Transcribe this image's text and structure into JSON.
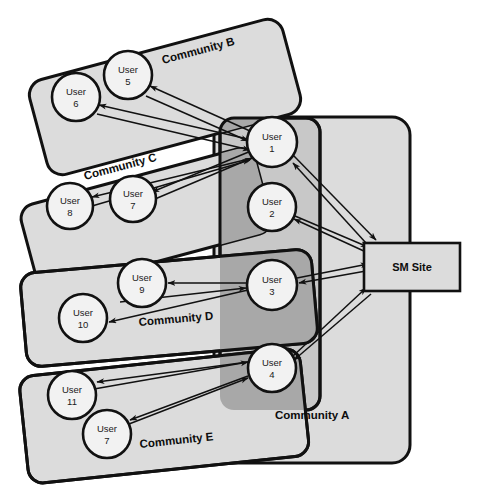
{
  "diagram": {
    "type": "node-link-diagram",
    "colors": {
      "community_fill_light": "#dcdcdc",
      "community_fill_mid": "#c8c8c8",
      "community_overlap_dark": "#a8a8a8",
      "node_fill": "#f2f2f2",
      "stroke": "#111111",
      "background": "#ffffff"
    },
    "site": {
      "label": "SM Site",
      "x": 364,
      "y": 243,
      "width": 96,
      "height": 48
    },
    "communities": [
      {
        "id": "A",
        "label": "Community A",
        "rotation": 0,
        "label_x": 275,
        "label_y": 419,
        "members": [
          "User 1",
          "User 2",
          "User 3",
          "User 4"
        ]
      },
      {
        "id": "B",
        "label": "Community B",
        "rotation": -15,
        "label_x": 163,
        "label_y": 64,
        "members": [
          "User 5",
          "User 6",
          "User 1"
        ]
      },
      {
        "id": "C",
        "label": "Community C",
        "rotation": -15,
        "label_x": 85,
        "label_y": 180,
        "members": [
          "User 7",
          "User 8",
          "User 1"
        ]
      },
      {
        "id": "D",
        "label": "Community D",
        "rotation": -5,
        "label_x": 139,
        "label_y": 326,
        "members": [
          "User 9",
          "User 10",
          "User 3"
        ]
      },
      {
        "id": "E",
        "label": "Community E",
        "rotation": -6,
        "label_x": 140,
        "label_y": 448,
        "members": [
          "User 11",
          "User 7",
          "User 4"
        ]
      }
    ],
    "nodes": [
      {
        "id": "u1",
        "line1": "User",
        "line2": "1",
        "cx": 272,
        "cy": 142,
        "r": 25
      },
      {
        "id": "u2",
        "line1": "User",
        "line2": "2",
        "cx": 272,
        "cy": 207,
        "r": 24
      },
      {
        "id": "u3",
        "line1": "User",
        "line2": "3",
        "cx": 272,
        "cy": 285,
        "r": 25
      },
      {
        "id": "u4",
        "line1": "User",
        "line2": "4",
        "cx": 272,
        "cy": 368,
        "r": 24
      },
      {
        "id": "u5",
        "line1": "User",
        "line2": "5",
        "cx": 128,
        "cy": 75,
        "r": 24
      },
      {
        "id": "u6",
        "line1": "User",
        "line2": "6",
        "cx": 76,
        "cy": 97,
        "r": 24
      },
      {
        "id": "u7c",
        "line1": "User",
        "line2": "7",
        "cx": 133,
        "cy": 199,
        "r": 23
      },
      {
        "id": "u8",
        "line1": "User",
        "line2": "8",
        "cx": 70,
        "cy": 206,
        "r": 23
      },
      {
        "id": "u9",
        "line1": "User",
        "line2": "9",
        "cx": 142,
        "cy": 283,
        "r": 24
      },
      {
        "id": "u10",
        "line1": "User",
        "line2": "10",
        "cx": 83,
        "cy": 318,
        "r": 24
      },
      {
        "id": "u11",
        "line1": "User",
        "line2": "11",
        "cx": 72,
        "cy": 395,
        "r": 24
      },
      {
        "id": "u7e",
        "line1": "User",
        "line2": "7",
        "cx": 107,
        "cy": 434,
        "r": 24
      }
    ],
    "edges": [
      {
        "from": "u1",
        "to": "u5",
        "label": ""
      },
      {
        "from": "u1",
        "to": "u6",
        "label": ""
      },
      {
        "from": "u1",
        "to": "u7c",
        "label": ""
      },
      {
        "from": "u1",
        "to": "u8",
        "label": ""
      },
      {
        "from": "u5",
        "to": "u1",
        "label": ""
      },
      {
        "from": "u6",
        "to": "u1",
        "label": ""
      },
      {
        "from": "u7c",
        "to": "u1",
        "label": ""
      },
      {
        "from": "u8",
        "to": "u1",
        "label": ""
      },
      {
        "from": "u1",
        "to": "site",
        "label": ""
      },
      {
        "from": "site",
        "to": "u1",
        "label": ""
      },
      {
        "from": "site",
        "to": "u2",
        "label": ""
      },
      {
        "from": "u2",
        "to": "site",
        "label": ""
      },
      {
        "from": "u3",
        "to": "u9",
        "label": ""
      },
      {
        "from": "u9",
        "to": "u3",
        "label": ""
      },
      {
        "from": "u3",
        "to": "u10",
        "label": ""
      },
      {
        "from": "u3",
        "to": "site",
        "label": ""
      },
      {
        "from": "site",
        "to": "u3",
        "label": ""
      },
      {
        "from": "u4",
        "to": "u11",
        "label": ""
      },
      {
        "from": "u11",
        "to": "u4",
        "label": ""
      },
      {
        "from": "u4",
        "to": "u7e",
        "label": ""
      },
      {
        "from": "u7e",
        "to": "u4",
        "label": ""
      },
      {
        "from": "u4",
        "to": "site",
        "label": ""
      },
      {
        "from": "site",
        "to": "u4",
        "label": ""
      }
    ]
  }
}
